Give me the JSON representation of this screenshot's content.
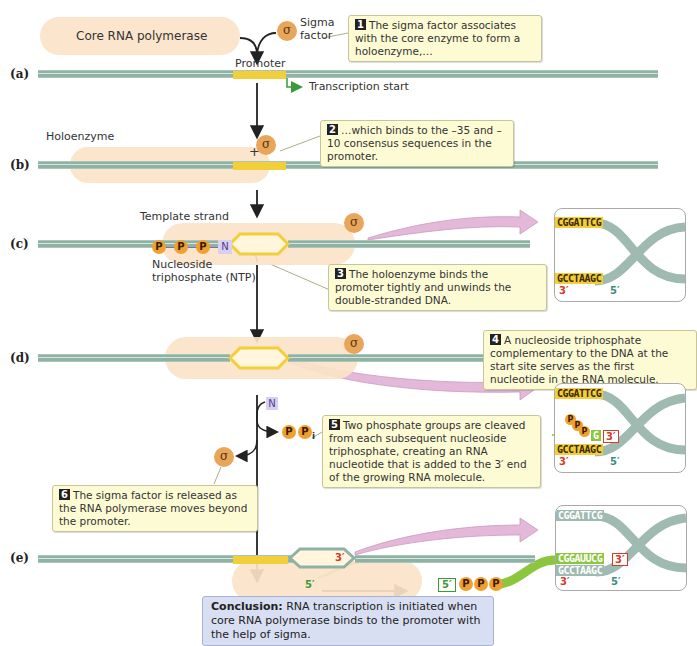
{
  "panels": {
    "a": "(a)",
    "b": "(b)",
    "c": "(c)",
    "d": "(d)",
    "e": "(e)"
  },
  "labels": {
    "core_rna_polymerase": "Core RNA polymerase",
    "sigma_symbol": "σ",
    "sigma_factor_line1": "Sigma",
    "sigma_factor_line2": "factor",
    "promoter": "Promoter",
    "transcription_start": "Transcription start",
    "holoenzyme": "Holoenzyme",
    "template_strand": "Template strand",
    "ntp_line1": "Nucleoside",
    "ntp_line2": "triphosphate (NTP)",
    "phosphate": "P",
    "nucleotide": "N",
    "pi_sub": "i",
    "plus": "+",
    "three_prime": "3′",
    "five_prime": "5′"
  },
  "callouts": [
    {
      "num": "1",
      "text": "The sigma factor associates with the core enzyme to form a holoenzyme,…"
    },
    {
      "num": "2",
      "text": "…which binds to the –35 and –10 consensus sequences in the promoter."
    },
    {
      "num": "3",
      "text": "The holoenzyme binds the promoter tightly and unwinds the double-stranded DNA."
    },
    {
      "num": "4",
      "text": "A nucleoside triphosphate complementary to the DNA at the start site serves as the first nucleotide in the RNA molecule."
    },
    {
      "num": "5",
      "text": "Two phosphate groups are cleaved from each subsequent nucleoside triphosphate, creating an RNA nucleotide that is added to the 3′ end of the growing RNA molecule."
    },
    {
      "num": "6",
      "text": "The sigma factor is released as the RNA polymerase moves beyond the promoter."
    }
  ],
  "sequences": {
    "top_strand": "CGGATTCG",
    "bottom_strand": "GCCTAAGC",
    "first_nt": "G",
    "rna": "CGGAUUCG"
  },
  "conclusion": {
    "label": "Conclusion:",
    "text": " RNA transcription is initiated when core RNA polymerase binds to the promoter with the help of sigma."
  },
  "colors": {
    "dna": "#8fb2a4",
    "promoter": "#f2cf3a",
    "enzyme": "#fbe3c8",
    "sigma": "#e8a65a",
    "callout_bg": "#fdfbd3",
    "rna": "#8cc63f",
    "conclusion_bg": "#d9dff2",
    "pink_arrow": "#e3b8d8"
  }
}
